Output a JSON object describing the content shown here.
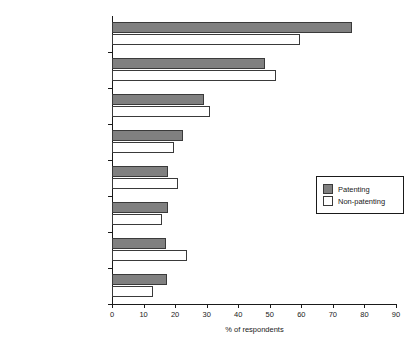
{
  "chart_data": {
    "type": "bar",
    "orientation": "horizontal",
    "title": "",
    "xlabel": "% of respondents",
    "ylabel": "",
    "xlim": [
      0,
      90
    ],
    "xticks": [
      0,
      10,
      20,
      30,
      40,
      50,
      60,
      70,
      80,
      90
    ],
    "grid": false,
    "legend_position": "right",
    "categories": [
      "Own R&D",
      "Technical/trade journal",
      "Friends/colleagues",
      "People at seminars",
      "Visiting other firms",
      "Research papers",
      "Newspapers/magazines",
      "Workshops/seminars"
    ],
    "series": [
      {
        "name": "Patenting",
        "color": "#808080",
        "values": [
          76,
          48.5,
          29,
          22.5,
          17.7,
          17.8,
          17,
          17.4
        ]
      },
      {
        "name": "Non-patenting",
        "color": "#ffffff",
        "values": [
          59.5,
          52,
          31,
          19.7,
          21,
          16,
          23.7,
          13
        ]
      }
    ]
  },
  "legend": {
    "items": [
      {
        "label": "Patenting"
      },
      {
        "label": "Non-patenting"
      }
    ]
  }
}
